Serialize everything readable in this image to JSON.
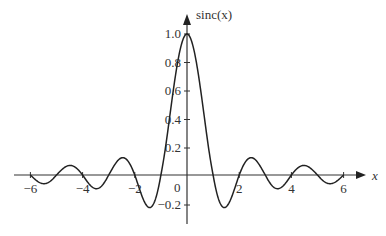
{
  "chart_data": {
    "type": "line",
    "title": "",
    "xlabel": "x",
    "ylabel": "sinc(x)",
    "function": "sinc(x) = sin(pi x)/(pi x)",
    "xlim": [
      -6,
      6
    ],
    "ylim": [
      -0.3,
      1.05
    ],
    "x_ticks": [
      "-6",
      "-4",
      "-2",
      "0",
      "2",
      "4",
      "6"
    ],
    "y_ticks": [
      "1.0",
      "0.8",
      "0.6",
      "0.4",
      "0.2",
      "-0.2"
    ],
    "grid": false,
    "legend": null,
    "series": [
      {
        "name": "sinc(x)",
        "x": [
          -6,
          -5.5,
          -5,
          -4.5,
          -4,
          -3.5,
          -3,
          -2.5,
          -2,
          -1.5,
          -1,
          -0.5,
          0,
          0.5,
          1,
          1.5,
          2,
          2.5,
          3,
          3.5,
          4,
          4.5,
          5,
          5.5,
          6
        ],
        "values": [
          0,
          -0.058,
          0,
          0.071,
          0,
          -0.091,
          0,
          0.127,
          0,
          -0.212,
          0,
          0.637,
          1.0,
          0.637,
          0,
          -0.212,
          0,
          0.127,
          0,
          -0.091,
          0,
          0.071,
          0,
          -0.058,
          0
        ]
      }
    ]
  },
  "labels": {
    "y_axis": "sinc(x)",
    "x_axis": "x",
    "origin": "0"
  }
}
